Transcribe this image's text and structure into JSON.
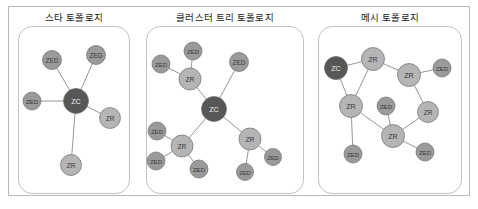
{
  "figure": {
    "width": 478,
    "height": 209,
    "background": "#ffffff",
    "frame_color": "#b9b9b9",
    "panel_border_color": "#c2c2c2"
  },
  "legend_colors": {
    "ZC": "#575757",
    "ZR": "#b5b5b5",
    "ZED": "#9a9a9a",
    "edge": "#8a8a8a",
    "label_light": "#3a3a3a",
    "label_dark": "#f0f0f0"
  },
  "node_types": {
    "ZC": "ZC",
    "ZR": "ZR",
    "ZED": "ZED"
  },
  "panels": [
    {
      "id": "star",
      "title": "스타 토폴로지",
      "x": 18,
      "y": 12,
      "width": 112,
      "height": 168,
      "nodes": [
        {
          "id": "s-zc",
          "label": "ZC",
          "type": "ZC",
          "x": 58,
          "y": 75,
          "r": 12.5
        },
        {
          "id": "s-zed1",
          "label": "ZED",
          "type": "ZED",
          "x": 34,
          "y": 34,
          "r": 9.5
        },
        {
          "id": "s-zed2",
          "label": "ZED",
          "type": "ZED",
          "x": 78,
          "y": 29,
          "r": 9.5
        },
        {
          "id": "s-zed3",
          "label": "ZED",
          "type": "ZED",
          "x": 14,
          "y": 75,
          "r": 9
        },
        {
          "id": "s-zr1",
          "label": "ZR",
          "type": "ZR",
          "x": 92,
          "y": 92,
          "r": 10.5
        },
        {
          "id": "s-zr2",
          "label": "ZR",
          "type": "ZR",
          "x": 53,
          "y": 139,
          "r": 10.5
        }
      ],
      "edges": [
        [
          "s-zc",
          "s-zed1"
        ],
        [
          "s-zc",
          "s-zed2"
        ],
        [
          "s-zc",
          "s-zed3"
        ],
        [
          "s-zc",
          "s-zr1"
        ],
        [
          "s-zc",
          "s-zr2"
        ]
      ]
    },
    {
      "id": "cluster-tree",
      "title": "클러스터 트리 토폴로지",
      "x": 146,
      "y": 12,
      "width": 158,
      "height": 168,
      "nodes": [
        {
          "id": "c-zc",
          "label": "ZC",
          "type": "ZC",
          "x": 68,
          "y": 83,
          "r": 12.5
        },
        {
          "id": "c-zr-t",
          "label": "ZR",
          "type": "ZR",
          "x": 44,
          "y": 53,
          "r": 11
        },
        {
          "id": "c-zed-t1",
          "label": "ZED",
          "type": "ZED",
          "x": 47,
          "y": 25,
          "r": 9
        },
        {
          "id": "c-zed-t2",
          "label": "ZED",
          "type": "ZED",
          "x": 15,
          "y": 38,
          "r": 9
        },
        {
          "id": "c-zed-top-r",
          "label": "ZED",
          "type": "ZED",
          "x": 93,
          "y": 36,
          "r": 9.5
        },
        {
          "id": "c-zr-l",
          "label": "ZR",
          "type": "ZR",
          "x": 36,
          "y": 120,
          "r": 11
        },
        {
          "id": "c-zed-l1",
          "label": "ZED",
          "type": "ZED",
          "x": 11,
          "y": 105,
          "r": 9
        },
        {
          "id": "c-zed-l2",
          "label": "ZED",
          "type": "ZED",
          "x": 10,
          "y": 135,
          "r": 9
        },
        {
          "id": "c-zed-l3",
          "label": "ZED",
          "type": "ZED",
          "x": 53,
          "y": 143,
          "r": 9
        },
        {
          "id": "c-zr-r",
          "label": "ZR",
          "type": "ZR",
          "x": 104,
          "y": 113,
          "r": 11
        },
        {
          "id": "c-zed-r1",
          "label": "ZED",
          "type": "ZED",
          "x": 127,
          "y": 131,
          "r": 8.5
        },
        {
          "id": "c-zed-r2",
          "label": "ZED",
          "type": "ZED",
          "x": 99,
          "y": 146,
          "r": 8.5
        }
      ],
      "edges": [
        [
          "c-zc",
          "c-zr-t"
        ],
        [
          "c-zr-t",
          "c-zed-t1"
        ],
        [
          "c-zr-t",
          "c-zed-t2"
        ],
        [
          "c-zc",
          "c-zed-top-r"
        ],
        [
          "c-zc",
          "c-zr-l"
        ],
        [
          "c-zr-l",
          "c-zed-l1"
        ],
        [
          "c-zr-l",
          "c-zed-l2"
        ],
        [
          "c-zr-l",
          "c-zed-l3"
        ],
        [
          "c-zc",
          "c-zr-r"
        ],
        [
          "c-zr-r",
          "c-zed-r1"
        ],
        [
          "c-zr-r",
          "c-zed-r2"
        ]
      ]
    },
    {
      "id": "mesh",
      "title": "메시 토폴로지",
      "x": 318,
      "y": 12,
      "width": 144,
      "height": 168,
      "nodes": [
        {
          "id": "m-zc",
          "label": "ZC",
          "type": "ZC",
          "x": 18,
          "y": 42,
          "r": 11.5
        },
        {
          "id": "m-zr1",
          "label": "ZR",
          "type": "ZR",
          "x": 55,
          "y": 33,
          "r": 11.5
        },
        {
          "id": "m-zr2",
          "label": "ZR",
          "type": "ZR",
          "x": 91,
          "y": 49,
          "r": 11.5
        },
        {
          "id": "m-zed1",
          "label": "ZED",
          "type": "ZED",
          "x": 124,
          "y": 42,
          "r": 9
        },
        {
          "id": "m-zr3",
          "label": "ZR",
          "type": "ZR",
          "x": 33,
          "y": 80,
          "r": 11.5
        },
        {
          "id": "m-zed2",
          "label": "ZED",
          "type": "ZED",
          "x": 68,
          "y": 80,
          "r": 9
        },
        {
          "id": "m-zr4",
          "label": "ZR",
          "type": "ZR",
          "x": 110,
          "y": 86,
          "r": 10.5
        },
        {
          "id": "m-zr5",
          "label": "ZR",
          "type": "ZR",
          "x": 75,
          "y": 110,
          "r": 11.5
        },
        {
          "id": "m-zed3",
          "label": "ZED",
          "type": "ZED",
          "x": 35,
          "y": 128,
          "r": 9
        },
        {
          "id": "m-zed4",
          "label": "ZED",
          "type": "ZED",
          "x": 107,
          "y": 126,
          "r": 9
        }
      ],
      "edges": [
        [
          "m-zc",
          "m-zr1"
        ],
        [
          "m-zc",
          "m-zr3"
        ],
        [
          "m-zr1",
          "m-zr2"
        ],
        [
          "m-zr1",
          "m-zr3"
        ],
        [
          "m-zr2",
          "m-zed1"
        ],
        [
          "m-zr2",
          "m-zr4"
        ],
        [
          "m-zr3",
          "m-zr5"
        ],
        [
          "m-zr3",
          "m-zed3"
        ],
        [
          "m-zed2",
          "m-zr5"
        ],
        [
          "m-zr4",
          "m-zr5"
        ],
        [
          "m-zr5",
          "m-zed4"
        ]
      ]
    }
  ]
}
